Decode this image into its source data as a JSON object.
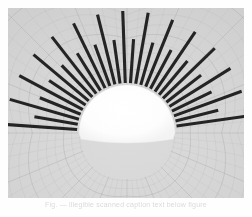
{
  "figure": {
    "background_color": "#d7d7d7",
    "mesh_color": "#a8a8a8",
    "spoke_color": "#1e1e1e",
    "core_color": "#fcfcfc",
    "frame": {
      "x": 8,
      "y": 8,
      "width": 236,
      "height": 190
    },
    "core": {
      "shape": "dome",
      "center_x": 127,
      "center_y": 133,
      "radius_x": 48,
      "radius_y": 48,
      "base_y": 140
    },
    "mesh": {
      "type": "polar",
      "radial_rings": 26,
      "angular_divisions": 64,
      "line_width": 0.35
    }
  },
  "chart_data": {
    "type": "scatter",
    "title": "",
    "subtitle": "",
    "xlabel": "",
    "ylabel": "",
    "legend": [],
    "annotations": [],
    "grid": true,
    "spokes": {
      "count": 29,
      "angle_start_deg": 184,
      "angle_end_deg": 356,
      "inner_radius": 50,
      "long_length": 72,
      "short_length": 44,
      "pattern": "alternating-long-short",
      "thickness": 3.1,
      "angles_deg": [
        184,
        190,
        196,
        202,
        208,
        214,
        220,
        226,
        232,
        238,
        244,
        250,
        256,
        262,
        268,
        274,
        280,
        286,
        292,
        298,
        304,
        310,
        316,
        322,
        328,
        334,
        340,
        346,
        352
      ],
      "lengths": [
        72,
        44,
        72,
        44,
        72,
        44,
        72,
        44,
        72,
        44,
        72,
        44,
        72,
        44,
        72,
        44,
        72,
        44,
        72,
        44,
        72,
        44,
        72,
        44,
        72,
        44,
        72,
        44,
        72
      ]
    }
  },
  "caption": {
    "text": "Fig.  —  illegible scanned caption text below figure"
  }
}
